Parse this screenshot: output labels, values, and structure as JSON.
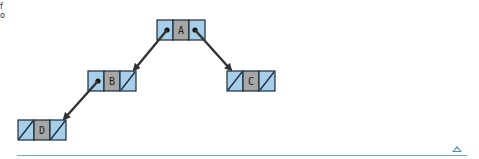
{
  "page": {
    "partial_text": [
      "f",
      "o"
    ]
  },
  "tree": {
    "nodes": [
      {
        "id": "A",
        "label": "A",
        "x": 157,
        "y": 20,
        "left": "pointer",
        "right": "pointer"
      },
      {
        "id": "B",
        "label": "B",
        "x": 88,
        "y": 71,
        "left": "pointer",
        "right": "null"
      },
      {
        "id": "C",
        "label": "C",
        "x": 227,
        "y": 71,
        "left": "null",
        "right": "null"
      },
      {
        "id": "D",
        "label": "D",
        "x": 18,
        "y": 120,
        "left": "null",
        "right": "null"
      }
    ],
    "edges": [
      {
        "from": "A",
        "to": "B",
        "side": "left"
      },
      {
        "from": "A",
        "to": "C",
        "side": "right"
      },
      {
        "from": "B",
        "to": "D",
        "side": "left"
      }
    ]
  },
  "colors": {
    "pointer_cell": "#a8cfea",
    "data_cell": "#a6a6a6",
    "border": "#1a2a3a",
    "arrow": "#333333",
    "rule": "#6aaed0"
  },
  "footer": {
    "scroll_up_icon": "triangle-up"
  }
}
